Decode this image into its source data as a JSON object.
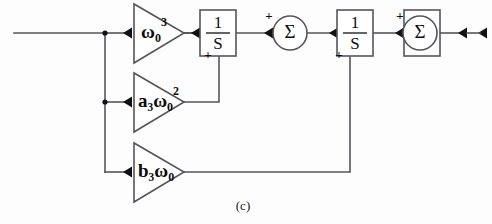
{
  "figure": {
    "caption": "(c)",
    "kind": "control-system-block-diagram",
    "colors": {
      "wire": "#55565a",
      "ink": "#0d0d10",
      "background": "#fdfdfd"
    }
  },
  "signal_flow": {
    "input_label": "",
    "output_label": ""
  },
  "gain_blocks": [
    {
      "id": "gain-omega-cubed",
      "base": "ω",
      "subscript": "0",
      "superscript": "3",
      "coefficient": "",
      "text": "ω₀³"
    },
    {
      "id": "gain-a3-omega-squared",
      "base": "ω",
      "subscript": "0",
      "superscript": "2",
      "coefficient": "a₃",
      "text": "a₃ω₀²"
    },
    {
      "id": "gain-b3-omega",
      "base": "ω",
      "subscript": "0",
      "superscript": "",
      "coefficient": "b₃",
      "text": "b₃ω₀"
    }
  ],
  "integrators": [
    {
      "id": "integrator-1",
      "numerator": "1",
      "denominator": "S",
      "text": "1/S"
    },
    {
      "id": "integrator-2",
      "numerator": "1",
      "denominator": "S",
      "text": "1/S"
    },
    {
      "id": "integrator-3",
      "numerator": "1",
      "denominator": "S",
      "text": "1/S"
    }
  ],
  "summers": [
    {
      "id": "summer-1",
      "symbol": "Σ",
      "input_signs": {
        "left": "+",
        "bottom": "+"
      }
    },
    {
      "id": "summer-2",
      "symbol": "Σ",
      "input_signs": {
        "left": "+",
        "bottom": "+"
      }
    }
  ]
}
